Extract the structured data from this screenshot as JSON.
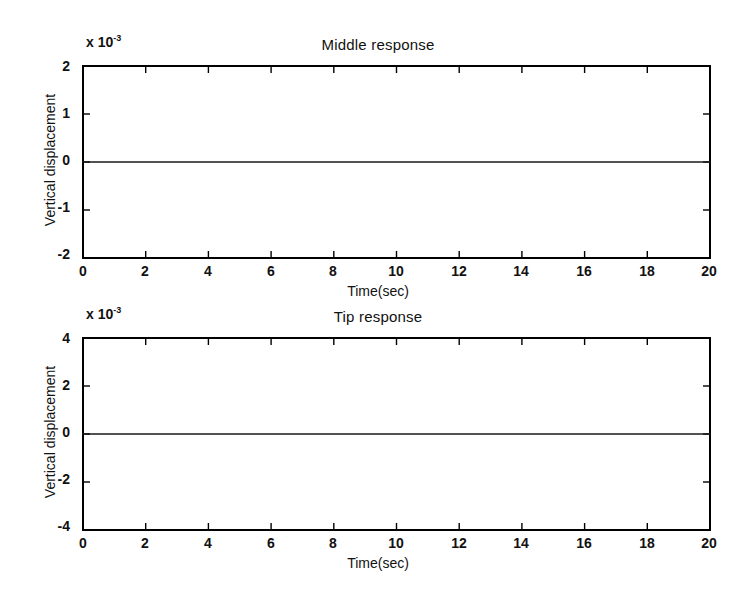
{
  "figure": {
    "background_color": "#ffffff",
    "line_color": "#1a1a1a",
    "axis_color": "#000000"
  },
  "panels": [
    {
      "id": "middle-response",
      "title": "Middle response",
      "exponent_prefix": "x 10",
      "exponent_power": "-3",
      "ylabel": "Vertical displacement",
      "xlabel": "Time(sec)",
      "yticks": [
        "2",
        "1",
        "0",
        "-1",
        "-2"
      ],
      "xticks": [
        "0",
        "2",
        "4",
        "6",
        "8",
        "10",
        "12",
        "14",
        "16",
        "18",
        "20"
      ]
    },
    {
      "id": "tip-response",
      "title": "Tip response",
      "exponent_prefix": "x 10",
      "exponent_power": "-3",
      "ylabel": "Vertical displacement",
      "xlabel": "Time(sec)",
      "yticks": [
        "4",
        "2",
        "0",
        "-2",
        "-4"
      ],
      "xticks": [
        "0",
        "2",
        "4",
        "6",
        "8",
        "10",
        "12",
        "14",
        "16",
        "18",
        "20"
      ]
    }
  ],
  "chart_data": [
    {
      "type": "line",
      "title": "Middle response",
      "xlabel": "Time(sec)",
      "ylabel": "Vertical displacement",
      "y_scale_exponent": -3,
      "y_scale_label": "x 10^-3",
      "xlim": [
        0,
        20
      ],
      "ylim": [
        -2,
        2
      ],
      "xticks": [
        0,
        2,
        4,
        6,
        8,
        10,
        12,
        14,
        16,
        18,
        20
      ],
      "yticks": [
        -2,
        -1,
        0,
        1,
        2
      ],
      "grid": false,
      "legend": false,
      "series": [
        {
          "name": "middle",
          "description": "Damped free-vibration response of beam midpoint; high-frequency transient burst during first ~1.5 s then a decaying fundamental mode of period ~1.7 s.",
          "model": {
            "mode1": {
              "amplitude": 0.00105,
              "period": 1.72,
              "damping_time_constant": 7.0,
              "phase_deg": -100
            },
            "transient": {
              "amplitude": 0.00165,
              "period": 0.23,
              "damping_time_constant": 0.42,
              "phase_deg": 0
            },
            "transient2": {
              "amplitude": 0.00055,
              "period": 0.48,
              "damping_time_constant": 0.85,
              "phase_deg": 40
            },
            "offset": -8e-05
          },
          "key_points": [
            {
              "t": 0.0,
              "y": 0.0
            },
            {
              "t": 0.1,
              "y": 0.0016
            },
            {
              "t": 0.22,
              "y": -0.00095
            },
            {
              "t": 0.35,
              "y": 0.00155
            },
            {
              "t": 0.48,
              "y": -0.0007
            },
            {
              "t": 0.6,
              "y": 0.0011
            },
            {
              "t": 0.72,
              "y": -0.00045
            },
            {
              "t": 0.85,
              "y": 0.0007
            },
            {
              "t": 0.98,
              "y": -0.00055
            },
            {
              "t": 1.15,
              "y": -0.00075
            },
            {
              "t": 1.3,
              "y": -0.00092
            },
            {
              "t": 1.45,
              "y": -0.0006
            },
            {
              "t": 2.15,
              "y": 0.00082
            },
            {
              "t": 3.0,
              "y": -0.00068
            },
            {
              "t": 3.9,
              "y": 0.0006
            },
            {
              "t": 4.7,
              "y": -0.00057
            },
            {
              "t": 5.6,
              "y": 0.00049
            },
            {
              "t": 6.45,
              "y": -0.00045
            },
            {
              "t": 7.3,
              "y": 0.0004
            },
            {
              "t": 8.15,
              "y": -0.00038
            },
            {
              "t": 9.0,
              "y": 0.00033
            },
            {
              "t": 9.85,
              "y": -0.00031
            },
            {
              "t": 10.7,
              "y": 0.00027
            },
            {
              "t": 11.55,
              "y": -0.00026
            },
            {
              "t": 12.4,
              "y": 0.00023
            },
            {
              "t": 13.25,
              "y": -0.00022
            },
            {
              "t": 14.1,
              "y": 0.00019
            },
            {
              "t": 14.95,
              "y": -0.00019
            },
            {
              "t": 15.8,
              "y": 0.00016
            },
            {
              "t": 16.65,
              "y": -0.00016
            },
            {
              "t": 17.5,
              "y": 0.00014
            },
            {
              "t": 18.35,
              "y": -0.00014
            },
            {
              "t": 19.2,
              "y": 0.00012
            },
            {
              "t": 20.0,
              "y": -0.0001
            }
          ]
        }
      ]
    },
    {
      "type": "line",
      "title": "Tip response",
      "xlabel": "Time(sec)",
      "ylabel": "Vertical displacement",
      "y_scale_exponent": -3,
      "y_scale_label": "x 10^-3",
      "xlim": [
        0,
        20
      ],
      "ylim": [
        -4,
        4
      ],
      "xticks": [
        0,
        2,
        4,
        6,
        8,
        10,
        12,
        14,
        16,
        18,
        20
      ],
      "yticks": [
        -4,
        -2,
        0,
        2,
        4
      ],
      "grid": false,
      "legend": false,
      "series": [
        {
          "name": "tip",
          "description": "Damped free-vibration response of beam tip; larger amplitude than midpoint, same ~1.7 s fundamental period with an initial high-frequency transient.",
          "model": {
            "mode1": {
              "amplitude": 0.0027,
              "period": 1.72,
              "damping_time_constant": 7.6,
              "phase_deg": -100
            },
            "transient": {
              "amplitude": 0.0023,
              "period": 0.23,
              "damping_time_constant": 0.45,
              "phase_deg": 0
            },
            "transient2": {
              "amplitude": 0.0009,
              "period": 0.48,
              "damping_time_constant": 0.9,
              "phase_deg": 40
            },
            "offset": -0.0001
          },
          "key_points": [
            {
              "t": 0.0,
              "y": 0.0018
            },
            {
              "t": 0.12,
              "y": 0.0039
            },
            {
              "t": 0.24,
              "y": 0.00075
            },
            {
              "t": 0.36,
              "y": 0.00345
            },
            {
              "t": 0.5,
              "y": 0.0011
            },
            {
              "t": 0.62,
              "y": 0.0029
            },
            {
              "t": 0.76,
              "y": 0.0006
            },
            {
              "t": 0.95,
              "y": 0.0003
            },
            {
              "t": 1.1,
              "y": -0.00205
            },
            {
              "t": 1.22,
              "y": -0.00165
            },
            {
              "t": 1.32,
              "y": -0.00285
            },
            {
              "t": 1.55,
              "y": -0.0022
            },
            {
              "t": 2.15,
              "y": 0.00225
            },
            {
              "t": 3.0,
              "y": -0.00205
            },
            {
              "t": 3.88,
              "y": 0.00192
            },
            {
              "t": 4.72,
              "y": -0.0017
            },
            {
              "t": 5.58,
              "y": 0.00145
            },
            {
              "t": 6.45,
              "y": -0.00135
            },
            {
              "t": 7.3,
              "y": 0.0012
            },
            {
              "t": 8.15,
              "y": -0.0011
            },
            {
              "t": 9.0,
              "y": 0.0009
            },
            {
              "t": 9.85,
              "y": -0.00088
            },
            {
              "t": 10.7,
              "y": 0.0007
            },
            {
              "t": 11.55,
              "y": -0.0007
            },
            {
              "t": 12.4,
              "y": 0.00055
            },
            {
              "t": 13.25,
              "y": -0.00055
            },
            {
              "t": 14.1,
              "y": 0.00048
            },
            {
              "t": 14.95,
              "y": -0.00045
            },
            {
              "t": 15.8,
              "y": 0.0004
            },
            {
              "t": 16.65,
              "y": -0.00038
            },
            {
              "t": 17.5,
              "y": 0.00032
            },
            {
              "t": 18.35,
              "y": -0.00032
            },
            {
              "t": 19.2,
              "y": 0.00028
            },
            {
              "t": 20.0,
              "y": -0.0002
            }
          ]
        }
      ]
    }
  ]
}
